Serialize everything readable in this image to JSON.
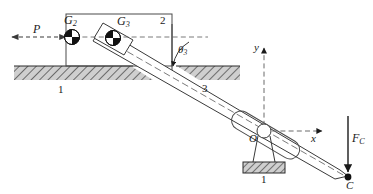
{
  "figure": {
    "colors": {
      "stroke": "#1a1a1a",
      "hatch_fill": "#c9c9c9",
      "hatch_line": "#4a4a4a",
      "dashed": "#6b6b6b",
      "marker_black": "#000000",
      "marker_white": "#ffffff",
      "background": "#ffffff"
    },
    "labels": {
      "force_p": "P",
      "cg_two": "G",
      "cg_two_sub": "2",
      "cg_three": "G",
      "cg_three_sub": "3",
      "link_two": "2",
      "link_three": "3",
      "ground_left": "1",
      "ground_bottom": "1",
      "angle_theta": "θ",
      "angle_theta_sub": "3",
      "axis_x": "x",
      "axis_y": "y",
      "origin": "O",
      "point_c": "C",
      "force_c": "F",
      "force_c_sub": "C"
    },
    "elements": {
      "p_arrow": "double-headed-dashed-horizontal-arrow",
      "x_axis": "dashed-arrow-right",
      "y_axis": "dashed-arrow-up",
      "fc_arrow": "solid-arrow-down",
      "theta_arc": "angle-arc-arrow",
      "pivot": "pin-joint-circle",
      "slider_block": "rectangle-link-2",
      "rod": "slender-rod-link-3",
      "ground_hatch_top": "hatched-ground-band",
      "ground_hatch_pivot": "hatched-ground-base",
      "cg_symbol": "center-of-mass-quadrant-circle"
    },
    "geometry": {
      "rod_angle_deg_from_vertical": 33,
      "point_c_x": 348,
      "point_c_y": 176,
      "origin_x": 264,
      "origin_y": 131
    }
  }
}
